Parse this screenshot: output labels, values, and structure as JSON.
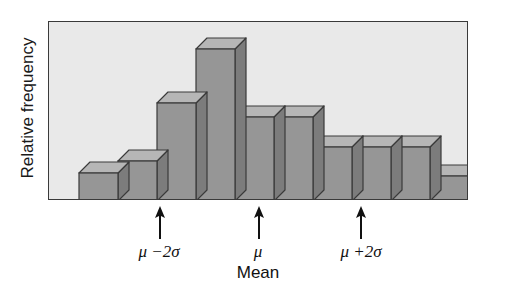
{
  "chart_data": {
    "type": "bar",
    "title": "",
    "subtitle": "",
    "xlabel": "Mean",
    "ylabel": "Relative frequency",
    "grid": false,
    "legend": null,
    "axis_tick_labels": [],
    "ylim": [
      0,
      1
    ],
    "note": "Bell-shaped (approximately normal) relative frequency histogram drawn as 3-D blocks; vertical axis is unlabeled relative frequency, horizontal axis marked only at mu-2sigma, mu and mu+2sigma.",
    "categories": [
      "1",
      "2",
      "3",
      "4",
      "5",
      "6",
      "7",
      "8",
      "9",
      "10"
    ],
    "values": [
      0.16,
      0.22,
      0.55,
      0.85,
      0.47,
      0.47,
      0.3,
      0.3,
      0.3,
      0.14
    ],
    "bar_pixel_heights": [
      28,
      40,
      98,
      152,
      84,
      84,
      54,
      54,
      54,
      25
    ],
    "annotations": [
      {
        "name": "mu-minus-2sigma",
        "label": "μ −2σ",
        "x_category_boundary": 3,
        "arrow": "up"
      },
      {
        "name": "mu",
        "label": "μ",
        "sublabel": "Mean",
        "x_category_boundary": 5.5,
        "arrow": "up"
      },
      {
        "name": "mu-plus-2sigma",
        "label": "μ +2σ",
        "x_category_boundary": 8,
        "arrow": "up"
      }
    ],
    "colors": {
      "plot_background": "#e9e9e9",
      "bar_front": "#969696",
      "bar_top": "#b6b6b6",
      "bar_side": "#7c7c7c",
      "bar_outline": "#3a3a3a",
      "frame": "#3a3a3a",
      "text": "#111111"
    }
  },
  "labels": {
    "y_axis": "Relative frequency",
    "mean_caption": "Mean",
    "mu_minus_2sigma": "μ −2σ",
    "mu": "μ",
    "mu_plus_2sigma": "μ +2σ"
  }
}
